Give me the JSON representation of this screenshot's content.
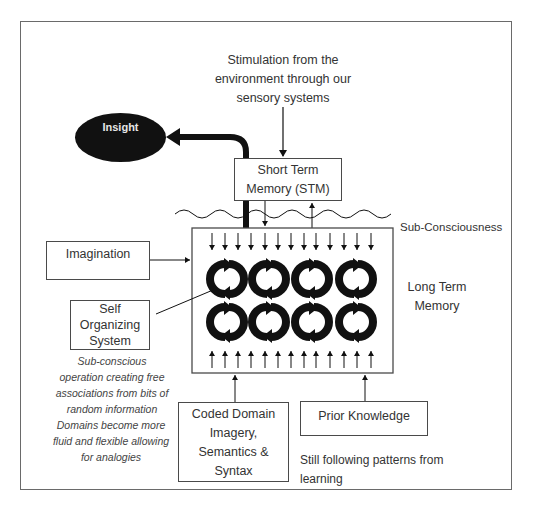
{
  "diagram": {
    "stimulation_label": "Stimulation from the environment through our sensory systems",
    "insight_label": "Insight",
    "stm_label": "Short Term Memory (STM)",
    "subconsciousness_label": "Sub-Consciousness",
    "imagination_label": "Imagination",
    "self_organizing_label": "Self Organizing System",
    "ltm_label": "Long Term Memory",
    "subconscious_note": "Sub-conscious operation creating free associations from bits of random information",
    "domains_note": "Domains become more fluid and flexible allowing for analogies",
    "coded_domain_label": "Coded Domain Imagery, Semantics & Syntax",
    "prior_knowledge_label": "Prior Knowledge",
    "learning_note": "Still following patterns from learning",
    "cycle_icon_count": 8,
    "colors": {
      "ink": "#111111",
      "border": "#4a4a4a",
      "text": "#333333"
    }
  }
}
